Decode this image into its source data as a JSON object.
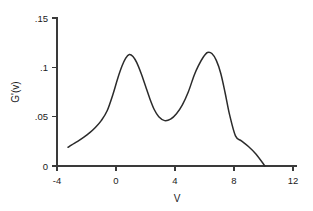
{
  "chart_data": {
    "type": "line",
    "title": "",
    "xlabel": "V",
    "ylabel": "G'(v)",
    "xlim": [
      -4,
      12
    ],
    "ylim": [
      0,
      0.15
    ],
    "grid": false,
    "legend": null,
    "x_ticks": [
      -4,
      0,
      4,
      8,
      12
    ],
    "x_tick_labels": [
      "-4",
      "0",
      "4",
      "8",
      "12"
    ],
    "y_ticks": [
      0,
      0.05,
      0.1,
      0.15
    ],
    "y_tick_labels": [
      "0",
      ".05",
      ".1",
      ".15"
    ],
    "series": [
      {
        "name": "G'(v)",
        "color": "#2b2b2b",
        "x": [
          -3.25,
          -3.0,
          -2.6,
          -2.2,
          -1.8,
          -1.4,
          -1.0,
          -0.6,
          -0.2,
          0.1,
          0.4,
          0.65,
          0.9,
          1.15,
          1.4,
          1.7,
          2.0,
          2.3,
          2.6,
          2.9,
          3.3,
          3.7,
          4.1,
          4.5,
          4.9,
          5.3,
          5.6,
          5.9,
          6.2,
          6.5,
          6.8,
          7.1,
          7.4,
          7.7,
          8.1,
          8.5,
          9.0,
          9.5,
          10.1
        ],
        "y": [
          0.019,
          0.0215,
          0.025,
          0.029,
          0.0335,
          0.039,
          0.046,
          0.056,
          0.073,
          0.088,
          0.101,
          0.109,
          0.113,
          0.111,
          0.105,
          0.094,
          0.081,
          0.068,
          0.057,
          0.05,
          0.046,
          0.0475,
          0.053,
          0.062,
          0.075,
          0.092,
          0.102,
          0.11,
          0.115,
          0.114,
          0.107,
          0.094,
          0.074,
          0.052,
          0.0305,
          0.0255,
          0.0195,
          0.012,
          0.0
        ]
      }
    ]
  },
  "figure": {
    "axis_color": "#3a3a3a",
    "curve_color": "#2b2b2b",
    "background": "#ffffff"
  }
}
